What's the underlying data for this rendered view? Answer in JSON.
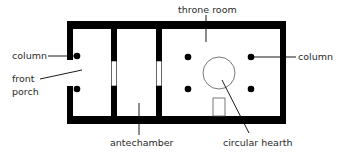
{
  "diagram": {
    "type": "floor-plan",
    "colors": {
      "wall": "#000000",
      "background": "#ffffff",
      "line": "#000000",
      "text": "#2a2a2a"
    },
    "rooms": [
      {
        "id": "front-porch",
        "label_lines": [
          "front",
          "porch"
        ]
      },
      {
        "id": "antechamber",
        "label": "antechamber"
      },
      {
        "id": "throne-room",
        "label": "throne room"
      }
    ],
    "features": {
      "column_left": "column",
      "column_right": "column",
      "hearth": "circular hearth"
    },
    "labels": {
      "column_left": "column",
      "front": "front",
      "porch": "porch",
      "antechamber": "antechamber",
      "throne_room": "throne room",
      "column_right": "column",
      "circular_hearth": "circular hearth"
    }
  }
}
